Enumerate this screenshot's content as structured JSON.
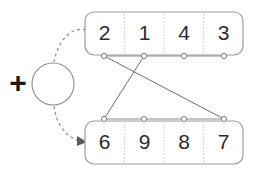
{
  "diagram": {
    "operator": {
      "symbol": "+",
      "node_label": ""
    },
    "top_register": {
      "name": "top-register",
      "cells": [
        "2",
        "1",
        "4",
        "3"
      ]
    },
    "bottom_register": {
      "name": "bottom-register",
      "cells": [
        "6",
        "9",
        "8",
        "7"
      ]
    },
    "connections": [
      {
        "from": "top-port-1",
        "to": "bottom-port-4"
      },
      {
        "from": "top-port-2",
        "to": "bottom-port-1"
      }
    ],
    "flows": [
      {
        "from": "top-register",
        "to": "operator",
        "arrow": false
      },
      {
        "from": "operator",
        "to": "bottom-register",
        "arrow": true
      }
    ],
    "colors": {
      "box_stroke": "#9a9a9a",
      "divider": "#cccccc",
      "line": "#6e6e6e",
      "text": "#2b2b2b",
      "background": "#ffffff"
    }
  }
}
